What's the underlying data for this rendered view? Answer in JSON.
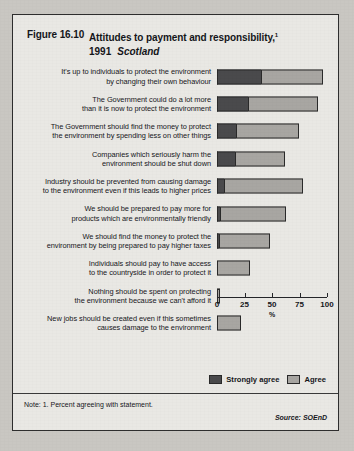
{
  "figure": {
    "number": "Figure 16.10",
    "title": "Attitudes to payment and responsibility,",
    "title_superscript": "1",
    "year": "1991",
    "region": "Scotland"
  },
  "legend": {
    "position": "bottom-right",
    "items": [
      {
        "label": "Strongly agree",
        "color": "#4a4a4c"
      },
      {
        "label": "Agree",
        "color": "#a8a6a2"
      }
    ]
  },
  "footer": {
    "note": "Note: 1.  Percent agreeing with statement.",
    "source": "Source: SOEnD"
  },
  "chart_data": {
    "type": "bar",
    "orientation": "horizontal",
    "stacked": true,
    "xlabel": "%",
    "ylabel": "",
    "xlim": [
      0,
      100
    ],
    "xticks": [
      0,
      25,
      50,
      75,
      100
    ],
    "xticklabels": [
      "0",
      "25",
      "50",
      "75",
      "100"
    ],
    "grid": false,
    "legend_position": "bottom-right",
    "categories": [
      "It's up to individuals to protect the environment by changing their own behaviour",
      "The Government could do a lot more than it is now to protect the environment",
      "The Government should find the money to protect the environment by spending less on other things",
      "Companies which seriously harm the environment should be shut down",
      "Industry should be prevented from causing damage to the environment even if this leads to higher prices",
      "We should be prepared to pay more for products which are environmentally friendly",
      "We should find the money to protect the environment by being prepared to pay higher taxes",
      "Individuals should pay to have access to the countryside in order to protect it",
      "Nothing should be spent on protecting the environment because we can't afford it",
      "New jobs should be created even if this sometimes causes damage to the environment"
    ],
    "category_lines": [
      [
        "It's up to individuals to protect the environment",
        "by changing their own behaviour"
      ],
      [
        "The Government could do a lot more",
        "than it is now to protect the environment"
      ],
      [
        "The Government should find the money to protect",
        "the environment by spending less on other things"
      ],
      [
        "Companies which seriously harm the",
        "environment should be shut down"
      ],
      [
        "Industry should be prevented from causing damage",
        "to the environment even if this leads to higher prices"
      ],
      [
        "We should be prepared to pay more for",
        "products which are environmentally friendly"
      ],
      [
        "We should find the money to protect the",
        "environment by being prepared to pay higher taxes"
      ],
      [
        "Individuals should pay to have access",
        "to the countryside in order to protect it"
      ],
      [
        "Nothing should be spent on protecting",
        "the environment because we can't afford it"
      ],
      [
        "New jobs should be created even if this sometimes",
        "causes damage to the environment"
      ]
    ],
    "series": [
      {
        "name": "Strongly agree",
        "color": "#4a4a4c",
        "values": [
          40,
          28,
          17,
          16,
          6,
          3,
          2,
          0,
          0,
          0
        ]
      },
      {
        "name": "Agree",
        "color": "#a8a6a2",
        "values": [
          56,
          64,
          58,
          46,
          72,
          60,
          46,
          30,
          3,
          22
        ]
      }
    ],
    "totals": [
      96,
      92,
      75,
      62,
      78,
      63,
      48,
      30,
      3,
      22
    ]
  }
}
